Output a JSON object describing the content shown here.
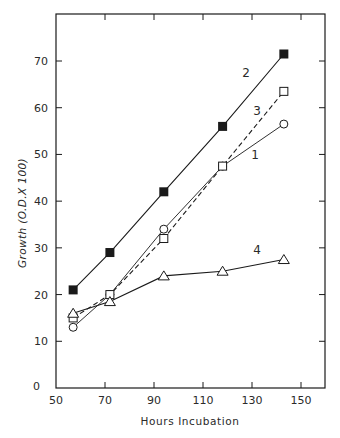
{
  "chart_data": {
    "type": "line",
    "title": "",
    "xlabel": "Hours Incubation",
    "ylabel": "Growth (O.D.X 100)",
    "xlim": [
      50,
      160
    ],
    "ylim": [
      0,
      80
    ],
    "xticks": [
      50,
      70,
      90,
      110,
      130,
      150
    ],
    "yticks": [
      0,
      10,
      20,
      30,
      40,
      50,
      60,
      70
    ],
    "xtick_labels": [
      "50",
      "70",
      "90",
      "110",
      "130",
      "150"
    ],
    "ytick_labels": [
      "0",
      "10",
      "20",
      "30",
      "40",
      "50",
      "60",
      "70"
    ],
    "grid": false,
    "legend": "inline labels",
    "x": [
      57,
      72,
      94,
      118,
      143
    ],
    "series": [
      {
        "name": "1",
        "marker": "open-circle",
        "line": "solid-thin",
        "values": [
          13,
          20,
          34,
          47.5,
          56.5
        ]
      },
      {
        "name": "2",
        "marker": "filled-square",
        "line": "solid",
        "values": [
          21,
          29,
          42,
          56,
          71.5
        ]
      },
      {
        "name": "3",
        "marker": "open-square",
        "line": "dashed",
        "values": [
          15,
          20,
          32,
          47.5,
          63.5
        ]
      },
      {
        "name": "4",
        "marker": "open-triangle",
        "line": "solid",
        "values": [
          16,
          18.5,
          24,
          25,
          27.5
        ]
      }
    ],
    "annotations": [
      {
        "text": "2",
        "near_series": "2"
      },
      {
        "text": "3",
        "near_series": "3"
      },
      {
        "text": "1",
        "near_series": "1"
      },
      {
        "text": "4",
        "near_series": "4"
      }
    ]
  },
  "colors": {
    "ink": "#1a1a1a",
    "background": "#ffffff"
  }
}
